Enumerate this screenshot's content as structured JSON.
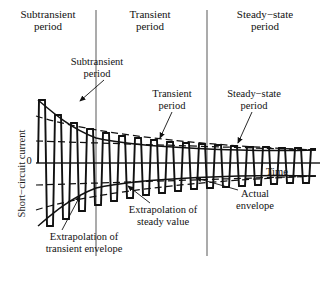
{
  "headers": [
    {
      "label": "Subtransient\nperiod",
      "x": 48
    },
    {
      "label": "Transient\nperiod",
      "x": 150
    },
    {
      "label": "Steady−state\nperiod",
      "x": 262
    }
  ],
  "axes": {
    "y_label": "Short−circuit current",
    "x_label": "Time",
    "zero_tick": "0"
  },
  "annotations": [
    {
      "name": "subtransient-period-callout",
      "text": "Subtransient\nperiod",
      "x": 97,
      "y": 64
    },
    {
      "name": "transient-period-callout",
      "text": "Transient\nperiod",
      "x": 172,
      "y": 96
    },
    {
      "name": "steady-state-period-callout",
      "text": "Steady−state\nperiod",
      "x": 253,
      "y": 96
    },
    {
      "name": "extrapolation-transient-envelope-callout",
      "text": "Extrapolation of\ntransient envelope",
      "x": 84,
      "y": 239
    },
    {
      "name": "extrapolation-steady-value-callout",
      "text": "Extrapolation of\nsteady value",
      "x": 163,
      "y": 212
    },
    {
      "name": "actual-envelope-callout",
      "text": "Actual\nenvelope",
      "x": 255,
      "y": 196
    }
  ],
  "dividers": [
    {
      "name": "divider-subtransient-transient",
      "x": 96
    },
    {
      "name": "divider-transient-steady",
      "x": 207
    }
  ],
  "colors": {
    "ink": "#111111",
    "divider": "#555555",
    "axis": "#222222"
  },
  "chart_data": {
    "type": "line",
    "xlabel": "Time",
    "ylabel": "Short−circuit current",
    "yticks": [
      0
    ],
    "grid": false,
    "legend": "none",
    "regions": [
      {
        "name": "Subtransient period",
        "x_start": 0,
        "x_end": 96
      },
      {
        "name": "Transient period",
        "x_start": 96,
        "x_end": 207
      },
      {
        "name": "Steady−state period",
        "x_start": 207,
        "x_end": 320
      }
    ],
    "series": [
      {
        "name": "Actual envelope (upper)",
        "style": "solid",
        "description": "Decaying upper envelope of the short-circuit current",
        "points": [
          [
            38,
            0.99
          ],
          [
            50,
            0.8
          ],
          [
            62,
            0.69
          ],
          [
            78,
            0.6
          ],
          [
            96,
            0.53
          ],
          [
            120,
            0.47
          ],
          [
            150,
            0.43
          ],
          [
            180,
            0.4
          ],
          [
            207,
            0.38
          ],
          [
            240,
            0.36
          ],
          [
            280,
            0.35
          ],
          [
            316,
            0.34
          ]
        ]
      },
      {
        "name": "Actual envelope (lower)",
        "style": "solid",
        "description": "Mirror of the upper envelope below the zero axis",
        "points": [
          [
            38,
            -0.99
          ],
          [
            50,
            -0.8
          ],
          [
            62,
            -0.69
          ],
          [
            78,
            -0.6
          ],
          [
            96,
            -0.53
          ],
          [
            120,
            -0.47
          ],
          [
            150,
            -0.43
          ],
          [
            180,
            -0.4
          ],
          [
            207,
            -0.38
          ],
          [
            240,
            -0.36
          ],
          [
            280,
            -0.35
          ],
          [
            316,
            -0.34
          ]
        ]
      },
      {
        "name": "Extrapolation of transient envelope",
        "style": "dashed",
        "description": "Straight dashed extension of the transient-period envelope back to t=0",
        "points": [
          [
            36,
            0.72
          ],
          [
            316,
            0.34
          ]
        ]
      },
      {
        "name": "Extrapolation of steady value",
        "style": "dashed",
        "description": "Dashed line marking the constant steady-state amplitude",
        "points": [
          [
            36,
            0.4
          ],
          [
            316,
            0.34
          ]
        ]
      }
    ],
    "oscillation": {
      "cycles": 18,
      "description": "Sinusoidal short-circuit current whose peak amplitude decays from the subtransient peak to a constant steady-state value"
    }
  }
}
